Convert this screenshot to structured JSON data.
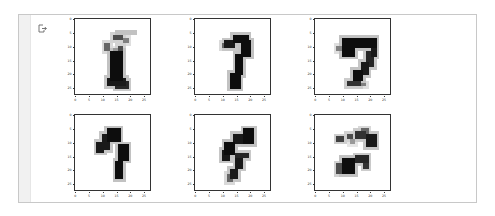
{
  "output_cell": {
    "icon": "output-redirect-icon"
  },
  "chart_data": [
    {
      "type": "heatmap",
      "title": "",
      "xlabel": "",
      "ylabel": "",
      "xticks": [
        0,
        5,
        10,
        15,
        20,
        25
      ],
      "yticks": [
        0,
        5,
        10,
        15,
        20,
        25
      ],
      "xlim": [
        0,
        27
      ],
      "ylim": [
        27,
        0
      ],
      "cmap": "gray_r",
      "shape": [
        28,
        28
      ],
      "description": "generated digit (resembles 2/8)"
    },
    {
      "type": "heatmap",
      "title": "",
      "xlabel": "",
      "ylabel": "",
      "xticks": [
        0,
        5,
        10,
        15,
        20,
        25
      ],
      "yticks": [
        0,
        5,
        10,
        15,
        20,
        25
      ],
      "xlim": [
        0,
        27
      ],
      "ylim": [
        27,
        0
      ],
      "cmap": "gray_r",
      "shape": [
        28,
        28
      ],
      "description": "generated digit (resembles 7)"
    },
    {
      "type": "heatmap",
      "title": "",
      "xlabel": "",
      "ylabel": "",
      "xticks": [
        0,
        5,
        10,
        15,
        20,
        25
      ],
      "yticks": [
        0,
        5,
        10,
        15,
        20,
        25
      ],
      "xlim": [
        0,
        27
      ],
      "ylim": [
        27,
        0
      ],
      "cmap": "gray_r",
      "shape": [
        28,
        28
      ],
      "description": "generated digit (resembles 7/9)"
    },
    {
      "type": "heatmap",
      "title": "",
      "xlabel": "",
      "ylabel": "",
      "xticks": [
        0,
        5,
        10,
        15,
        20,
        25
      ],
      "yticks": [
        0,
        5,
        10,
        15,
        20,
        25
      ],
      "xlim": [
        0,
        27
      ],
      "ylim": [
        27,
        0
      ],
      "cmap": "gray_r",
      "shape": [
        28,
        28
      ],
      "description": "generated digit (resembles 7/3)"
    },
    {
      "type": "heatmap",
      "title": "",
      "xlabel": "",
      "ylabel": "",
      "xticks": [
        0,
        5,
        10,
        15,
        20,
        25
      ],
      "yticks": [
        0,
        5,
        10,
        15,
        20,
        25
      ],
      "xlim": [
        0,
        27
      ],
      "ylim": [
        27,
        0
      ],
      "cmap": "gray_r",
      "shape": [
        28,
        28
      ],
      "description": "generated digit (resembles 9)"
    },
    {
      "type": "heatmap",
      "title": "",
      "xlabel": "",
      "ylabel": "",
      "xticks": [
        0,
        5,
        10,
        15,
        20,
        25
      ],
      "yticks": [
        0,
        5,
        10,
        15,
        20,
        25
      ],
      "xlim": [
        0,
        27
      ],
      "ylim": [
        27,
        0
      ],
      "cmap": "gray_r",
      "shape": [
        28,
        28
      ],
      "description": "generated digit (resembles 3/8)"
    }
  ],
  "plots": [
    {
      "left": 46,
      "top": 3,
      "strokes": [
        [
          5,
          16,
          4,
          21,
          0.95
        ],
        [
          6,
          14,
          7,
          17,
          0.7
        ],
        [
          9,
          11,
          11,
          12,
          0.6
        ],
        [
          10,
          16,
          12,
          17,
          0.7
        ],
        [
          12,
          13,
          22,
          17,
          0.95
        ],
        [
          22,
          12,
          24,
          18,
          0.9
        ],
        [
          23,
          15,
          25,
          19,
          0.85
        ],
        [
          7,
          18,
          8,
          19,
          0.5
        ],
        [
          11,
          14,
          11,
          15,
          0.4
        ]
      ]
    },
    {
      "left": 166,
      "top": 3,
      "strokes": [
        [
          6,
          14,
          8,
          19,
          0.95
        ],
        [
          8,
          11,
          10,
          14,
          0.9
        ],
        [
          8,
          17,
          13,
          20,
          0.95
        ],
        [
          10,
          19,
          12,
          20,
          0.85
        ],
        [
          13,
          15,
          20,
          17,
          0.95
        ],
        [
          20,
          13,
          25,
          16,
          0.95
        ],
        [
          9,
          10,
          10,
          11,
          0.6
        ]
      ]
    },
    {
      "left": 286,
      "top": 3,
      "strokes": [
        [
          7,
          10,
          13,
          14,
          0.95
        ],
        [
          7,
          15,
          10,
          22,
          0.95
        ],
        [
          9,
          21,
          13,
          22,
          0.9
        ],
        [
          12,
          19,
          17,
          21,
          0.85
        ],
        [
          16,
          17,
          20,
          19,
          0.9
        ],
        [
          19,
          14,
          22,
          17,
          0.95
        ],
        [
          23,
          12,
          24,
          16,
          0.8
        ],
        [
          24,
          17,
          24,
          18,
          0.5
        ],
        [
          10,
          8,
          11,
          10,
          0.5
        ]
      ]
    },
    {
      "left": 46,
      "top": 99,
      "strokes": [
        [
          5,
          12,
          9,
          16,
          0.95
        ],
        [
          7,
          10,
          12,
          12,
          0.9
        ],
        [
          10,
          8,
          13,
          10,
          0.9
        ],
        [
          11,
          16,
          16,
          19,
          0.95
        ],
        [
          17,
          15,
          23,
          17,
          0.95
        ],
        [
          14,
          16,
          15,
          16,
          0.5
        ]
      ]
    },
    {
      "left": 166,
      "top": 99,
      "strokes": [
        [
          5,
          18,
          10,
          21,
          0.95
        ],
        [
          7,
          14,
          10,
          17,
          0.9
        ],
        [
          10,
          11,
          14,
          14,
          0.95
        ],
        [
          13,
          10,
          16,
          12,
          0.9
        ],
        [
          14,
          15,
          15,
          19,
          0.85
        ],
        [
          16,
          15,
          19,
          17,
          0.9
        ],
        [
          20,
          13,
          23,
          15,
          0.9
        ],
        [
          22,
          12,
          24,
          13,
          0.6
        ]
      ]
    },
    {
      "left": 286,
      "top": 99,
      "strokes": [
        [
          6,
          15,
          8,
          18,
          0.8
        ],
        [
          5,
          17,
          7,
          19,
          0.6
        ],
        [
          7,
          19,
          11,
          22,
          0.9
        ],
        [
          7,
          12,
          8,
          13,
          0.7
        ],
        [
          8,
          8,
          9,
          10,
          0.75
        ],
        [
          9,
          13,
          10,
          14,
          0.4
        ],
        [
          15,
          15,
          17,
          19,
          0.85
        ],
        [
          16,
          10,
          21,
          14,
          0.95
        ],
        [
          18,
          8,
          21,
          11,
          0.7
        ],
        [
          16,
          18,
          19,
          19,
          0.8
        ]
      ]
    }
  ]
}
